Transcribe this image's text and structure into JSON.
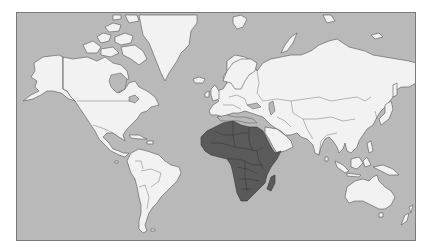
{
  "map": {
    "projection": "mercator",
    "subject": "World map",
    "highlighted_region": "Africa",
    "colors": {
      "ocean": "#b9b9b9",
      "land": "#f2f2f2",
      "highlight": "#5a5a5a",
      "border": "#555555",
      "frame": "#7a7a7a"
    },
    "regions": [
      {
        "name": "North America",
        "highlighted": false
      },
      {
        "name": "Greenland",
        "highlighted": false
      },
      {
        "name": "South America",
        "highlighted": false
      },
      {
        "name": "Europe",
        "highlighted": false
      },
      {
        "name": "Asia",
        "highlighted": false
      },
      {
        "name": "Africa",
        "highlighted": true
      },
      {
        "name": "Madagascar",
        "highlighted": true
      },
      {
        "name": "Australia",
        "highlighted": false
      },
      {
        "name": "New Zealand",
        "highlighted": false
      }
    ]
  }
}
